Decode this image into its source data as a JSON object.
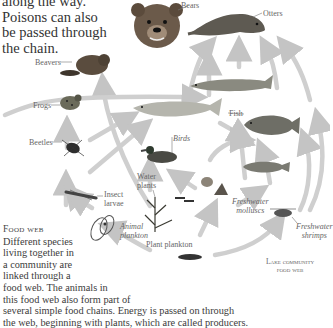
{
  "intro": {
    "line1": "along the way.",
    "line2": "Poisons can also",
    "line3": "be passed through",
    "line4": "the chain."
  },
  "labels": {
    "bears": "Bears",
    "otters": "Otters",
    "beavers": "Beavers",
    "frogs": "Frogs",
    "beetles": "Beetles",
    "fish": "Fish",
    "birds": "Birds",
    "water_plants_1": "Water",
    "water_plants_2": "plants",
    "insect_larvae_1": "Insect",
    "insect_larvae_2": "larvae",
    "animal_plankton_1": "Animal",
    "animal_plankton_2": "plankton",
    "plant_plankton": "Plant plankton",
    "freshwater_molluscs_1": "Freshwater",
    "freshwater_molluscs_2": "molluscs",
    "freshwater_shrimps_1": "Freshwater",
    "freshwater_shrimps_2": "shrimps"
  },
  "caption": {
    "title": "Food web",
    "line1": "Different species",
    "line2": "living together in",
    "line3": "a community are",
    "line4": "linked through a",
    "line5": "food web. The animals in",
    "line6": "this food web also form part of",
    "line7": "several simple food chains. Energy is passed on through",
    "line8": "the web, beginning with plants, which are called producers."
  },
  "figure_title": {
    "line1": "Lake community",
    "line2": "food web"
  },
  "colors": {
    "arrow": "#c8c8c8",
    "text": "#3a3a3a",
    "label": "#666666"
  }
}
